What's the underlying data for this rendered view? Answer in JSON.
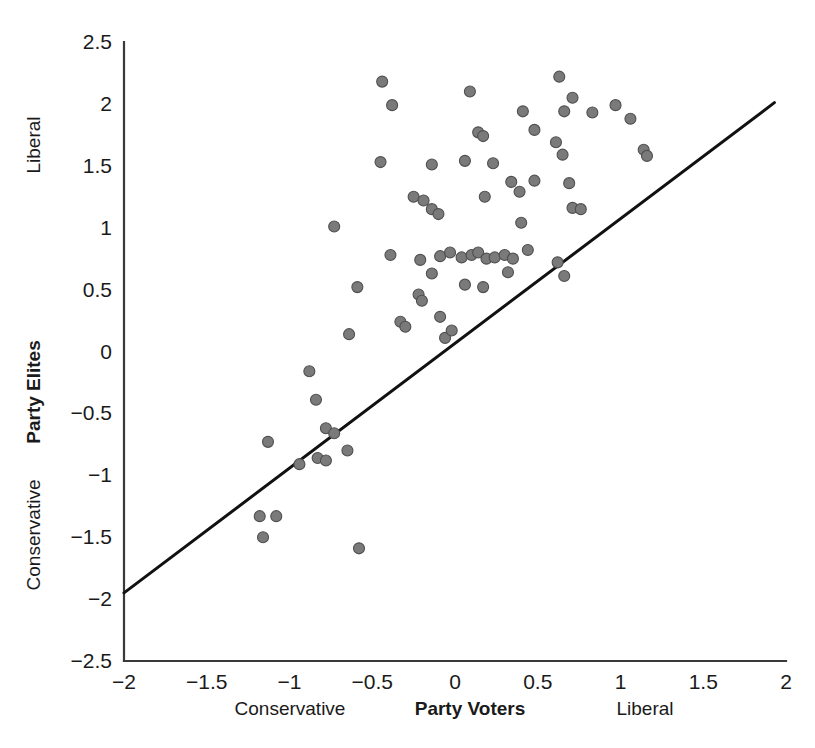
{
  "chart_data": {
    "type": "scatter",
    "title": "",
    "xlabel": "Party Voters",
    "ylabel": "Party Elites",
    "xlim": [
      -2,
      2
    ],
    "ylim": [
      -2.5,
      2.5
    ],
    "grid": false,
    "legend": "none",
    "x_ticks": [
      "-2",
      "-1.5",
      "-1",
      "-0.5",
      "0",
      "0.5",
      "1",
      "1.5",
      "2"
    ],
    "x_tick_values": [
      -2,
      -1.5,
      -1,
      -0.5,
      0,
      0.5,
      1,
      1.5,
      2
    ],
    "y_ticks": [
      "2.5",
      "2",
      "1.5",
      "1",
      "0.5",
      "0",
      "-0.5",
      "-1",
      "-1.5",
      "-2",
      "-2.5"
    ],
    "y_tick_values": [
      2.5,
      2,
      1.5,
      1,
      0.5,
      0,
      -0.5,
      -1,
      -1.5,
      -2,
      -2.5
    ],
    "x_axis_anchor_low": "Conservative",
    "x_axis_anchor_high": "Liberal",
    "y_axis_anchor_low": "Conservative",
    "y_axis_anchor_high": "Liberal",
    "marker_fill": "#7a7a7a",
    "marker_edge": "#4f4f4f",
    "marker_size_px": 11,
    "line_color": "#111111",
    "fit_line": {
      "x0": -2.0,
      "y0": -1.95,
      "x1": 1.93,
      "y1": 2.01
    },
    "points": [
      {
        "x": -0.44,
        "y": 2.18
      },
      {
        "x": -0.38,
        "y": 1.99
      },
      {
        "x": 0.09,
        "y": 2.1
      },
      {
        "x": 0.63,
        "y": 2.22
      },
      {
        "x": 0.71,
        "y": 2.05
      },
      {
        "x": 0.41,
        "y": 1.94
      },
      {
        "x": 0.66,
        "y": 1.94
      },
      {
        "x": 0.83,
        "y": 1.93
      },
      {
        "x": 0.97,
        "y": 1.99
      },
      {
        "x": 1.06,
        "y": 1.88
      },
      {
        "x": 0.14,
        "y": 1.77
      },
      {
        "x": 0.17,
        "y": 1.74
      },
      {
        "x": 0.48,
        "y": 1.79
      },
      {
        "x": 0.61,
        "y": 1.69
      },
      {
        "x": 0.65,
        "y": 1.59
      },
      {
        "x": 1.14,
        "y": 1.63
      },
      {
        "x": 1.16,
        "y": 1.58
      },
      {
        "x": -0.45,
        "y": 1.53
      },
      {
        "x": -0.14,
        "y": 1.51
      },
      {
        "x": 0.06,
        "y": 1.54
      },
      {
        "x": 0.23,
        "y": 1.52
      },
      {
        "x": 0.34,
        "y": 1.37
      },
      {
        "x": 0.48,
        "y": 1.38
      },
      {
        "x": 0.69,
        "y": 1.36
      },
      {
        "x": -0.25,
        "y": 1.25
      },
      {
        "x": -0.19,
        "y": 1.22
      },
      {
        "x": -0.14,
        "y": 1.15
      },
      {
        "x": -0.1,
        "y": 1.11
      },
      {
        "x": 0.18,
        "y": 1.25
      },
      {
        "x": 0.39,
        "y": 1.29
      },
      {
        "x": 0.4,
        "y": 1.04
      },
      {
        "x": 0.71,
        "y": 1.16
      },
      {
        "x": 0.76,
        "y": 1.15
      },
      {
        "x": -0.73,
        "y": 1.01
      },
      {
        "x": -0.39,
        "y": 0.78
      },
      {
        "x": -0.21,
        "y": 0.74
      },
      {
        "x": -0.22,
        "y": 0.46
      },
      {
        "x": -0.2,
        "y": 0.41
      },
      {
        "x": -0.59,
        "y": 0.52
      },
      {
        "x": -0.14,
        "y": 0.63
      },
      {
        "x": -0.09,
        "y": 0.77
      },
      {
        "x": -0.03,
        "y": 0.8
      },
      {
        "x": 0.04,
        "y": 0.76
      },
      {
        "x": 0.1,
        "y": 0.78
      },
      {
        "x": 0.14,
        "y": 0.8
      },
      {
        "x": 0.19,
        "y": 0.75
      },
      {
        "x": 0.24,
        "y": 0.76
      },
      {
        "x": 0.3,
        "y": 0.78
      },
      {
        "x": 0.35,
        "y": 0.75
      },
      {
        "x": 0.44,
        "y": 0.82
      },
      {
        "x": 0.62,
        "y": 0.72
      },
      {
        "x": 0.66,
        "y": 0.61
      },
      {
        "x": 0.32,
        "y": 0.64
      },
      {
        "x": 0.06,
        "y": 0.54
      },
      {
        "x": -0.09,
        "y": 0.28
      },
      {
        "x": -0.06,
        "y": 0.11
      },
      {
        "x": -0.02,
        "y": 0.17
      },
      {
        "x": 0.17,
        "y": 0.52
      },
      {
        "x": -0.33,
        "y": 0.24
      },
      {
        "x": -0.3,
        "y": 0.2
      },
      {
        "x": -0.64,
        "y": 0.14
      },
      {
        "x": -0.88,
        "y": -0.16
      },
      {
        "x": -0.84,
        "y": -0.39
      },
      {
        "x": -0.78,
        "y": -0.62
      },
      {
        "x": -0.73,
        "y": -0.66
      },
      {
        "x": -0.65,
        "y": -0.8
      },
      {
        "x": -1.13,
        "y": -0.73
      },
      {
        "x": -0.94,
        "y": -0.91
      },
      {
        "x": -0.83,
        "y": -0.86
      },
      {
        "x": -0.78,
        "y": -0.88
      },
      {
        "x": -1.18,
        "y": -1.33
      },
      {
        "x": -1.08,
        "y": -1.33
      },
      {
        "x": -1.16,
        "y": -1.5
      },
      {
        "x": -0.58,
        "y": -1.59
      }
    ]
  },
  "axes": {
    "y_title": "Party Elites",
    "x_title": "Party Voters",
    "y_high_anchor": "Liberal",
    "y_low_anchor": "Conservative",
    "x_low_anchor": "Conservative",
    "x_high_anchor": "Liberal"
  }
}
